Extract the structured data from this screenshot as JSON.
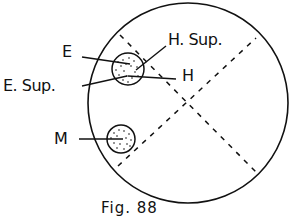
{
  "figure": {
    "caption": "Fig. 88",
    "labels": {
      "e": "E",
      "e_sup": "E. Sup.",
      "h_sup": "H. Sup.",
      "h": "H",
      "m": "M"
    },
    "colors": {
      "ink": "#111111",
      "background": "#ffffff"
    }
  }
}
